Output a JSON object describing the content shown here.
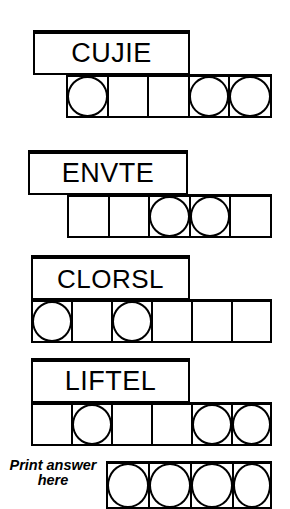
{
  "puzzle": {
    "title": "Word scramble circle puzzle",
    "rows": [
      {
        "id": "row-1",
        "word": "CUJIE",
        "cells": 5,
        "circles": [
          true,
          false,
          false,
          true,
          true
        ],
        "circle_count": 3
      },
      {
        "id": "row-2",
        "word": "ENVTE",
        "cells": 5,
        "circles": [
          false,
          false,
          true,
          true,
          false
        ],
        "circle_count": 2
      },
      {
        "id": "row-3",
        "word": "CLORSL",
        "cells": 6,
        "circles": [
          true,
          false,
          true,
          false,
          false,
          false
        ],
        "circle_count": 2
      },
      {
        "id": "row-4",
        "word": "LIFTEL",
        "cells": 6,
        "circles": [
          false,
          true,
          false,
          false,
          true,
          true
        ],
        "circle_count": 3
      }
    ],
    "answer": {
      "label_line_1": "Print answer",
      "label_line_2": "here",
      "cells": 4,
      "circles": [
        true,
        true,
        true,
        true
      ]
    }
  },
  "colors": {
    "ink": "#000000",
    "paper": "#ffffff"
  }
}
